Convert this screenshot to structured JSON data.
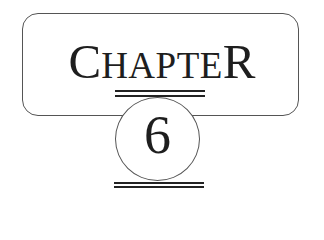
{
  "heading": {
    "first_letter": "C",
    "middle_letters": "HAPTE",
    "last_letter": "R",
    "full_text": "CHAPTER"
  },
  "chapter_number": "6",
  "colors": {
    "ink": "#1e1e1e",
    "frame": "#555555",
    "background": "#ffffff"
  }
}
